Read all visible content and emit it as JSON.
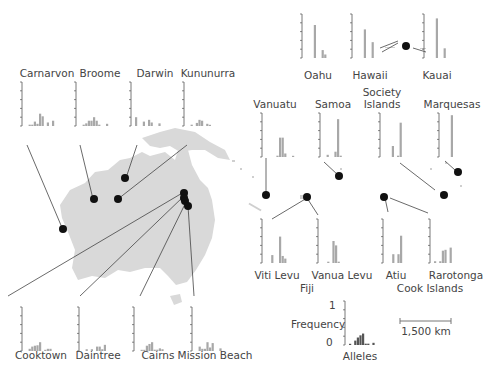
{
  "colors": {
    "land": "#d9d9d9",
    "bar": "#a8a8a8",
    "bar_legend": "#555555",
    "axis": "#555555",
    "marker": "#111111",
    "leader": "#444444",
    "text": "#444444"
  },
  "legend": {
    "y_label": "Frequency",
    "y_max": "1",
    "y_min": "0",
    "x_label": "Alleles"
  },
  "scale_bar": {
    "label": "1,500 km"
  },
  "group_labels": {
    "fiji": "Fiji",
    "cook": "Cook Islands"
  },
  "chart_data": [
    {
      "type": "bar",
      "title": "Carnarvon",
      "values": [
        0,
        0.03,
        0.03,
        0.1,
        0.05,
        0.28,
        0.22,
        0,
        0.08,
        0,
        0.12
      ]
    },
    {
      "type": "bar",
      "title": "Broome",
      "values": [
        0,
        0.03,
        0.06,
        0.12,
        0.12,
        0.2,
        0.12,
        0.03,
        0,
        0,
        0.05
      ]
    },
    {
      "type": "bar",
      "title": "Darwin",
      "values": [
        0.2,
        0,
        0,
        0.1,
        0,
        0.14,
        0.08,
        0,
        0,
        0.06,
        0
      ]
    },
    {
      "type": "bar",
      "title": "Kununurra",
      "values": [
        0,
        0.03,
        0,
        0.07,
        0.14,
        0.12,
        0,
        0.05,
        0.02,
        0,
        0
      ]
    },
    {
      "type": "bar",
      "title": "Oahu",
      "values": [
        0,
        0,
        0,
        0.75,
        0,
        0,
        0.18,
        0.08
      ]
    },
    {
      "type": "bar",
      "title": "Hawaii",
      "values": [
        0,
        0,
        0,
        0.65,
        0,
        0,
        0.36
      ]
    },
    {
      "type": "bar",
      "title": "Kauai",
      "values": [
        0,
        0,
        0,
        0.9,
        0,
        0,
        0.22
      ]
    },
    {
      "type": "bar",
      "title": "Vanuatu",
      "values": [
        0,
        0,
        0,
        0,
        0.03,
        0.44,
        0.44,
        0.08,
        0,
        0,
        0.02
      ]
    },
    {
      "type": "bar",
      "title": "Samoa",
      "values": [
        0,
        0.05,
        0,
        0,
        0.12,
        0.86,
        0.03
      ]
    },
    {
      "type": "bar",
      "title": "Society Islands",
      "values": [
        0,
        0,
        0,
        0.25,
        0,
        0.03,
        0.78
      ]
    },
    {
      "type": "bar",
      "title": "Marquesas",
      "values": [
        0,
        0,
        0,
        0.95
      ]
    },
    {
      "type": "bar",
      "title": "Viti Levu",
      "values": [
        0,
        0,
        0.18,
        0,
        0,
        0.6,
        0.16,
        0.1
      ]
    },
    {
      "type": "bar",
      "title": "Vanua Levu",
      "values": [
        0,
        0,
        0.03,
        0,
        0.5,
        0.4,
        0.03
      ]
    },
    {
      "type": "bar",
      "title": "Atiu",
      "values": [
        0,
        0,
        0.2,
        0,
        0.2,
        0.62
      ]
    },
    {
      "type": "bar",
      "title": "Rarotonga",
      "values": [
        0.04,
        0,
        0.04,
        0.28,
        0.3,
        0,
        0.35
      ]
    },
    {
      "type": "bar",
      "title": "Cooktown",
      "values": [
        0,
        0.05,
        0.1,
        0.12,
        0.13,
        0.2,
        0,
        0.02,
        0.05,
        0.05
      ]
    },
    {
      "type": "bar",
      "title": "Daintree",
      "values": [
        0,
        0.04,
        0,
        0.04,
        0,
        0.1,
        0.1,
        0.04,
        0.14
      ]
    },
    {
      "type": "bar",
      "title": "Cairns",
      "values": [
        0,
        0.02,
        0.02,
        0.12,
        0.16,
        0.2,
        0.03,
        0.03,
        0.06,
        0.04
      ]
    },
    {
      "type": "bar",
      "title": "Mission Beach",
      "values": [
        0,
        0.1,
        0.05,
        0.05,
        0.2,
        0.08,
        0.18,
        0,
        0,
        0.06
      ]
    },
    {
      "type": "bar",
      "title": "Legend",
      "xlabel": "Alleles",
      "ylabel": "Frequency",
      "ylim": [
        0,
        1
      ],
      "values": [
        0.02,
        0,
        0.1,
        0.17,
        0.22,
        0.26,
        0.03,
        0.03,
        0,
        0.05
      ]
    }
  ]
}
